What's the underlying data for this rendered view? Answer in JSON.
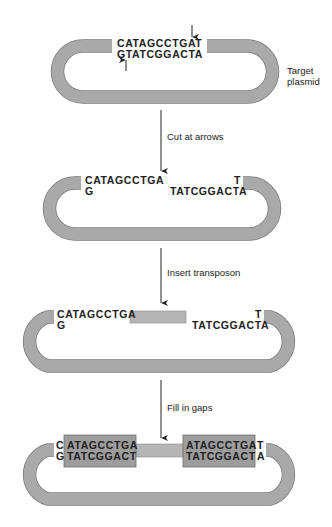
{
  "colors": {
    "plasmid": "#a7a7a7",
    "transposon": "#b3b3b3",
    "filled_box": "#9d9d9d",
    "text": "#222222",
    "arrow": "#222222"
  },
  "stage1": {
    "label_line1": "Target",
    "label_line2": "plasmid",
    "top_strand": "CATAGCCTGAT",
    "bottom_strand": "GTATCGGACTA"
  },
  "step1": {
    "label": "Cut at arrows"
  },
  "stage2": {
    "left_top": "CATAGCCTGA",
    "left_bottom": "G",
    "right_top": "T",
    "right_bottom": "TATCGGACTA"
  },
  "step2": {
    "label": "Insert transposon"
  },
  "stage3": {
    "left_top": "CATAGCCTGA",
    "left_bottom": "G",
    "right_top": "T",
    "right_bottom": "TATCGGACTA"
  },
  "step3": {
    "label": "Fill in gaps"
  },
  "stage4": {
    "left_end_top": "C",
    "left_end_bottom": "G",
    "left_box_top": "ATAGCCTGA",
    "left_box_bottom": "TATCGGACT",
    "right_box_top": "ATAGCCTGA",
    "right_box_bottom": "TATCGGACT",
    "right_end_top": "T",
    "right_end_bottom": "A"
  }
}
